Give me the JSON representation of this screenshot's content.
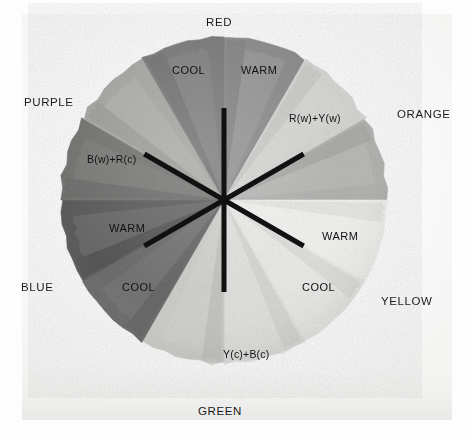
{
  "figure": {
    "kind": "color-wheel-photograph",
    "background_color": "#fdfdfd",
    "paper_color": "#f6f6f5"
  },
  "wheel": {
    "center_x": 224,
    "center_y": 200,
    "radius": 163,
    "segment_count": 12,
    "segment_span_degrees": 30
  },
  "hue_labels": [
    {
      "name": "RED",
      "text": "RED",
      "x": 206,
      "y": 16,
      "angle_deg": 0
    },
    {
      "name": "ORANGE",
      "text": "ORANGE",
      "x": 397,
      "y": 108,
      "angle_deg": 60
    },
    {
      "name": "YELLOW",
      "text": "YELLOW",
      "x": 381,
      "y": 295,
      "angle_deg": 120
    },
    {
      "name": "GREEN",
      "text": "GREEN",
      "x": 198,
      "y": 405,
      "angle_deg": 180
    },
    {
      "name": "BLUE",
      "text": "BLUE",
      "x": 21,
      "y": 281,
      "angle_deg": 240
    },
    {
      "name": "PURPLE",
      "text": "PURPLE",
      "x": 24,
      "y": 96,
      "angle_deg": 300
    }
  ],
  "segment_labels": [
    {
      "name": "red-cool",
      "text": "COOL",
      "x": 172,
      "y": 64,
      "tone": "dark"
    },
    {
      "name": "red-warm",
      "text": "WARM",
      "x": 241,
      "y": 64,
      "tone": "dark"
    },
    {
      "name": "blue-warm",
      "text": "WARM",
      "x": 109,
      "y": 222,
      "tone": "dark"
    },
    {
      "name": "blue-cool",
      "text": "COOL",
      "x": 122,
      "y": 281,
      "tone": "dark"
    },
    {
      "name": "yellow-warm",
      "text": "WARM",
      "x": 322,
      "y": 230,
      "tone": "light"
    },
    {
      "name": "yellow-cool",
      "text": "COOL",
      "x": 302,
      "y": 281,
      "tone": "light"
    }
  ],
  "mix_labels": [
    {
      "name": "orange-mix",
      "text": "R(w)+Y(w)",
      "x": 289,
      "y": 112
    },
    {
      "name": "purple-mix",
      "text": "B(w)+R(c)",
      "x": 87,
      "y": 153
    },
    {
      "name": "green-mix",
      "text": "Y(c)+B(c)",
      "x": 223,
      "y": 348
    }
  ],
  "arrows": [
    {
      "name": "vertical-axis",
      "angle_deg": 0,
      "length": 92,
      "double_headed": true
    },
    {
      "name": "orange-blue-axis",
      "angle_deg": 60,
      "length": 92,
      "double_headed": true
    },
    {
      "name": "yellow-purple-axis",
      "angle_deg": 120,
      "length": 92,
      "double_headed": true
    }
  ],
  "arrow_style": {
    "color": "#111111",
    "shaft_width": 5,
    "head_length": 19,
    "head_width": 15
  },
  "segments": [
    {
      "name": "red-warm",
      "index": 0,
      "start_deg": 0,
      "end_deg": 30,
      "fill": "#8e8e8e",
      "hue": "RED",
      "temperature": "WARM"
    },
    {
      "name": "orange-warm",
      "index": 1,
      "start_deg": 30,
      "end_deg": 60,
      "fill": "#d6d6d4",
      "hue": "ORANGE",
      "temperature": "WARM"
    },
    {
      "name": "orange-cool",
      "index": 2,
      "start_deg": 60,
      "end_deg": 90,
      "fill": "#b4b4b2",
      "hue": "ORANGE",
      "temperature": "COOL"
    },
    {
      "name": "yellow-warm",
      "index": 3,
      "start_deg": 90,
      "end_deg": 120,
      "fill": "#f3f3f1",
      "hue": "YELLOW",
      "temperature": "WARM"
    },
    {
      "name": "yellow-cool",
      "index": 4,
      "start_deg": 120,
      "end_deg": 150,
      "fill": "#ebebe9",
      "hue": "YELLOW",
      "temperature": "COOL"
    },
    {
      "name": "green-cool",
      "index": 5,
      "start_deg": 150,
      "end_deg": 180,
      "fill": "#e2e2e0",
      "hue": "GREEN",
      "temperature": "COOL"
    },
    {
      "name": "green-warm",
      "index": 6,
      "start_deg": 180,
      "end_deg": 210,
      "fill": "#cfcfcc",
      "hue": "GREEN",
      "temperature": "WARM"
    },
    {
      "name": "blue-cool",
      "index": 7,
      "start_deg": 210,
      "end_deg": 240,
      "fill": "#6f6f6f",
      "hue": "BLUE",
      "temperature": "COOL"
    },
    {
      "name": "blue-warm",
      "index": 8,
      "start_deg": 240,
      "end_deg": 270,
      "fill": "#5e5e5e",
      "hue": "BLUE",
      "temperature": "WARM"
    },
    {
      "name": "purple-warm",
      "index": 9,
      "start_deg": 270,
      "end_deg": 300,
      "fill": "#767674",
      "hue": "PURPLE",
      "temperature": "WARM"
    },
    {
      "name": "purple-cool",
      "index": 10,
      "start_deg": 300,
      "end_deg": 330,
      "fill": "#a8a8a5",
      "hue": "PURPLE",
      "temperature": "COOL"
    },
    {
      "name": "red-cool",
      "index": 11,
      "start_deg": 330,
      "end_deg": 360,
      "fill": "#7c7c7c",
      "hue": "RED",
      "temperature": "COOL"
    }
  ]
}
